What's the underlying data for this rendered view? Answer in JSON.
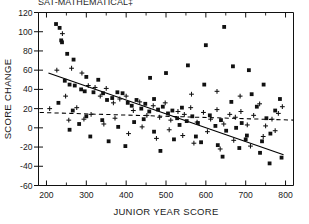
{
  "chart_data": {
    "type": "scatter",
    "title": "SAT-MATHEMATICAL‡",
    "xlabel": "JUNIOR YEAR SCORE",
    "ylabel": "SCORE CHANGE",
    "xlim": [
      180,
      820
    ],
    "ylim": [
      -60,
      120
    ],
    "xticks": [
      200,
      300,
      400,
      500,
      600,
      700,
      800
    ],
    "xticks_minor": [
      250,
      350,
      450,
      550,
      650,
      750
    ],
    "yticks": [
      -60,
      -40,
      -20,
      0,
      20,
      40,
      60,
      80,
      100,
      120
    ],
    "grid": false,
    "legend": "none",
    "series": [
      {
        "name": "square-markers",
        "marker": "square",
        "points": [
          [
            224,
            108
          ],
          [
            233,
            104
          ],
          [
            237,
            91
          ],
          [
            239,
            89
          ],
          [
            252,
            77
          ],
          [
            268,
            71
          ],
          [
            246,
            49
          ],
          [
            258,
            45
          ],
          [
            271,
            44
          ],
          [
            287,
            40
          ],
          [
            296,
            38
          ],
          [
            300,
            53
          ],
          [
            318,
            37
          ],
          [
            330,
            50
          ],
          [
            342,
            36
          ],
          [
            352,
            29
          ],
          [
            365,
            31
          ],
          [
            378,
            37
          ],
          [
            391,
            36
          ],
          [
            404,
            26
          ],
          [
            414,
            23
          ],
          [
            426,
            29
          ],
          [
            438,
            20
          ],
          [
            448,
            25
          ],
          [
            458,
            17
          ],
          [
            470,
            30
          ],
          [
            480,
            19
          ],
          [
            492,
            22
          ],
          [
            505,
            15
          ],
          [
            516,
            18
          ],
          [
            528,
            10
          ],
          [
            540,
            21
          ],
          [
            552,
            7
          ],
          [
            566,
            12
          ],
          [
            580,
            5
          ],
          [
            596,
            45
          ],
          [
            610,
            13
          ],
          [
            624,
            2
          ],
          [
            638,
            8
          ],
          [
            651,
            -3
          ],
          [
            664,
            27
          ],
          [
            676,
            0
          ],
          [
            690,
            5
          ],
          [
            703,
            -8
          ],
          [
            715,
            35
          ],
          [
            728,
            22
          ],
          [
            741,
            -14
          ],
          [
            752,
            10
          ],
          [
            762,
            -6
          ],
          [
            774,
            18
          ],
          [
            600,
            86
          ],
          [
            646,
            105
          ],
          [
            555,
            65
          ],
          [
            500,
            57
          ],
          [
            460,
            52
          ],
          [
            708,
            60
          ],
          [
            668,
            64
          ],
          [
            745,
            45
          ],
          [
            300,
            12
          ],
          [
            340,
            8
          ],
          [
            380,
            1
          ],
          [
            420,
            6
          ],
          [
            470,
            -4
          ],
          [
            520,
            -12
          ],
          [
            575,
            -9
          ],
          [
            630,
            -18
          ],
          [
            684,
            -21
          ],
          [
            736,
            -26
          ],
          [
            790,
            -31
          ],
          [
            258,
            -2
          ],
          [
            282,
            4
          ],
          [
            310,
            -9
          ],
          [
            356,
            -14
          ],
          [
            398,
            -19
          ],
          [
            444,
            9
          ],
          [
            486,
            -24
          ],
          [
            534,
            3
          ],
          [
            588,
            -15
          ],
          [
            642,
            -30
          ],
          [
            700,
            -12
          ],
          [
            760,
            -37
          ],
          [
            786,
            30
          ],
          [
            230,
            26
          ],
          [
            266,
            18
          ]
        ]
      },
      {
        "name": "plus-markers",
        "marker": "plus",
        "points": [
          [
            240,
            98
          ],
          [
            263,
            62
          ],
          [
            289,
            57
          ],
          [
            305,
            44
          ],
          [
            322,
            42
          ],
          [
            335,
            33
          ],
          [
            350,
            41
          ],
          [
            368,
            26
          ],
          [
            384,
            30
          ],
          [
            400,
            33
          ],
          [
            418,
            18
          ],
          [
            434,
            27
          ],
          [
            452,
            13
          ],
          [
            468,
            23
          ],
          [
            484,
            11
          ],
          [
            498,
            26
          ],
          [
            512,
            8
          ],
          [
            530,
            17
          ],
          [
            546,
            14
          ],
          [
            562,
            21
          ],
          [
            578,
            6
          ],
          [
            594,
            16
          ],
          [
            612,
            9
          ],
          [
            628,
            19
          ],
          [
            645,
            4
          ],
          [
            660,
            14
          ],
          [
            674,
            11
          ],
          [
            688,
            17
          ],
          [
            704,
            3
          ],
          [
            720,
            13
          ],
          [
            735,
            25
          ],
          [
            750,
            2
          ],
          [
            766,
            9
          ],
          [
            782,
            15
          ],
          [
            248,
            33
          ],
          [
            276,
            21
          ],
          [
            294,
            9
          ],
          [
            312,
            14
          ],
          [
            344,
            4
          ],
          [
            372,
            10
          ],
          [
            406,
            -6
          ],
          [
            440,
            1
          ],
          [
            476,
            -11
          ],
          [
            508,
            -2
          ],
          [
            542,
            -8
          ],
          [
            570,
            -16
          ],
          [
            604,
            -4
          ],
          [
            636,
            -22
          ],
          [
            670,
            -13
          ],
          [
            712,
            -19
          ],
          [
            744,
            -9
          ],
          [
            774,
            -3
          ],
          [
            792,
            22
          ],
          [
            686,
            33
          ],
          [
            628,
            38
          ],
          [
            564,
            35
          ],
          [
            226,
            60
          ],
          [
            256,
            8
          ],
          [
            208,
            20
          ]
        ]
      }
    ],
    "fit_lines": [
      {
        "name": "solid-regression",
        "style": "solid",
        "x1": 205,
        "y1": 57,
        "x2": 795,
        "y2": -28
      },
      {
        "name": "dashed-regression",
        "style": "dashed",
        "x1": 183,
        "y1": 16,
        "x2": 820,
        "y2": 8
      }
    ]
  }
}
